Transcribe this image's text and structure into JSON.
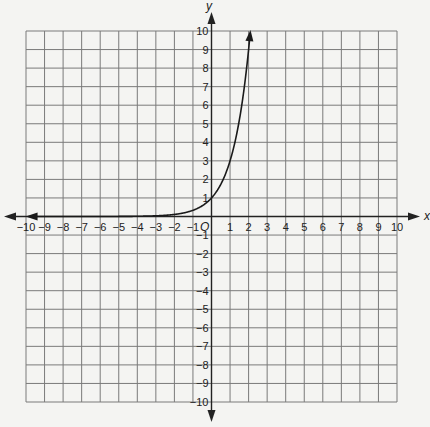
{
  "chart_data": {
    "type": "line",
    "title": "",
    "xlabel": "x",
    "ylabel": "y",
    "origin_label": "O",
    "xlim": [
      -10,
      10
    ],
    "ylim": [
      -10,
      10
    ],
    "grid": true,
    "x_ticks": [
      -10,
      -9,
      -8,
      -7,
      -6,
      -5,
      -4,
      -3,
      -2,
      -1,
      1,
      2,
      3,
      4,
      5,
      6,
      7,
      8,
      9,
      10
    ],
    "y_ticks": [
      -10,
      -9,
      -8,
      -7,
      -6,
      -5,
      -4,
      -3,
      -2,
      -1,
      1,
      2,
      3,
      4,
      5,
      6,
      7,
      8,
      9,
      10
    ],
    "series": [
      {
        "name": "y = 3^x",
        "function": "3^x",
        "x": [
          -10,
          -5,
          -4,
          -3,
          -2,
          -1,
          0,
          1,
          2,
          2.1
        ],
        "values": [
          2e-05,
          0.004,
          0.012,
          0.037,
          0.111,
          0.333,
          1,
          3,
          9,
          10
        ],
        "arrows": [
          "left",
          "up"
        ],
        "color": "#1a1a1a"
      }
    ]
  },
  "colors": {
    "background": "#f4f4f2",
    "grid": "#7a7a7a",
    "axis": "#222222"
  }
}
